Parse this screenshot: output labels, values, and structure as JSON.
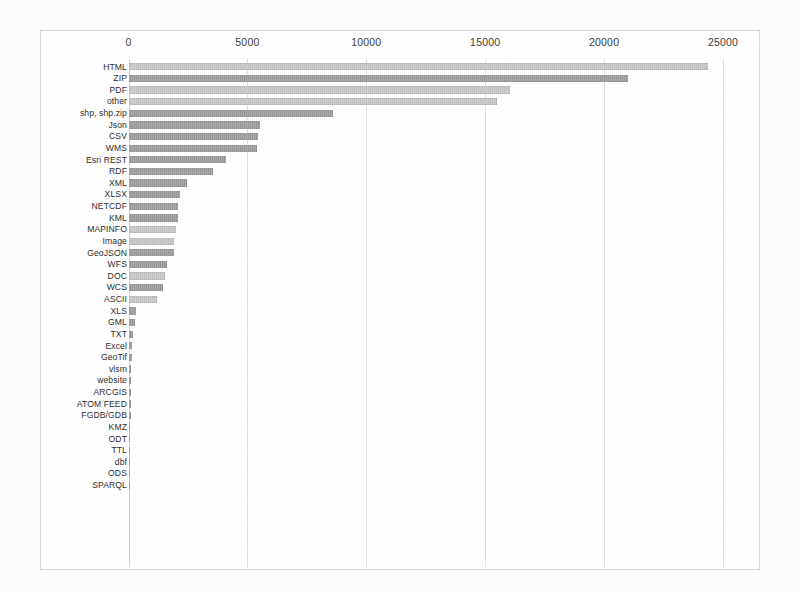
{
  "chart_data": {
    "type": "bar",
    "orientation": "horizontal",
    "title": "",
    "xlabel": "",
    "ylabel": "",
    "xlim": [
      0,
      25000
    ],
    "grid": true,
    "axis_position": "top",
    "legend": "none",
    "tick_labels": [
      "0",
      "5000",
      "10000",
      "15000",
      "20000",
      "25000"
    ],
    "tick_values": [
      0,
      5000,
      10000,
      15000,
      20000,
      25000
    ],
    "categories": [
      "HTML",
      "ZIP",
      "PDF",
      "other",
      "shp, shp.zip",
      "Json",
      "CSV",
      "WMS",
      "Esri REST",
      "RDF",
      "XML",
      "XLSX",
      "NETCDF",
      "KML",
      "MAPINFO",
      "Image",
      "GeoJSON",
      "WFS",
      "DOC",
      "WCS",
      "ASCII",
      "XLS",
      "GML",
      "TXT",
      "Excel",
      "GeoTif",
      "vlsm",
      "website",
      "ARCGIS",
      "ATOM FEED",
      "FGDB/GDB",
      "KMZ",
      "ODT",
      "TTL",
      "dbf",
      "ODS",
      "SPARQL"
    ],
    "values": [
      24370,
      20990,
      16050,
      15500,
      8620,
      5510,
      5460,
      5420,
      4110,
      3570,
      2460,
      2180,
      2100,
      2080,
      1980,
      1930,
      1900,
      1620,
      1530,
      1430,
      1180,
      300,
      260,
      180,
      150,
      130,
      120,
      110,
      100,
      95,
      90,
      80,
      75,
      70,
      60,
      55,
      50
    ],
    "bar_shades": [
      "light",
      "dark",
      "light",
      "light",
      "dark",
      "dark",
      "dark",
      "dark",
      "dark",
      "dark",
      "dark",
      "dark",
      "dark",
      "dark",
      "light",
      "light",
      "dark",
      "dark",
      "light",
      "dark",
      "light",
      "dark",
      "dark",
      "dark",
      "dark",
      "dark",
      "dark",
      "dark",
      "dark",
      "dark",
      "dark",
      "dark",
      "dark",
      "dark",
      "dark",
      "dark",
      "dark"
    ],
    "colors": {
      "bar_light": "#c6c6c6",
      "bar_dark": "#9a9a9a",
      "gridline": "#dedede",
      "frame_border": "#d8d8d6",
      "text": "#2e2e2e",
      "background": "#ffffff"
    }
  }
}
